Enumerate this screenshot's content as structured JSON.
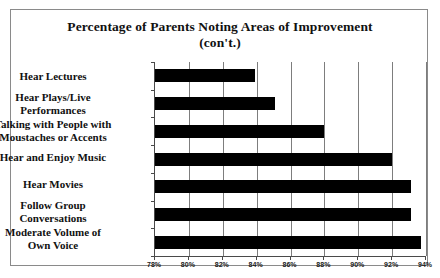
{
  "chart_data": {
    "type": "bar",
    "orientation": "horizontal",
    "title": "Percentage of Parents Noting Areas of Improvement (con't.)",
    "title_line1": "Percentage of Parents Noting Areas of Improvement",
    "title_line2": "(con't.)",
    "categories": [
      "Hear Lectures",
      "Hear Plays/Live Performances",
      "Talking with People with Moustaches or Accents",
      "Hear and Enjoy Music",
      "Hear Movies",
      "Follow Group Conversations",
      "Moderate Volume of Own Voice"
    ],
    "category_lines": [
      [
        "Hear Lectures"
      ],
      [
        "Hear Plays/Live",
        "Performances"
      ],
      [
        "Talking with People with",
        "Moustaches or Accents"
      ],
      [
        "Hear and Enjoy Music"
      ],
      [
        "Hear Movies"
      ],
      [
        "Follow Group",
        "Conversations"
      ],
      [
        "Moderate Volume of",
        "Own Voice"
      ]
    ],
    "values": [
      83.9,
      85.1,
      88.0,
      92.0,
      93.1,
      93.1,
      93.7
    ],
    "xlabel": "",
    "ylabel": "",
    "xlim": [
      78,
      94
    ],
    "xtick_values": [
      78,
      80,
      82,
      84,
      86,
      88,
      90,
      92,
      94
    ],
    "xtick_labels": [
      "78%",
      "80%",
      "82%",
      "84%",
      "86%",
      "88%",
      "90%",
      "92%",
      "94%"
    ],
    "grid": true,
    "legend": false,
    "bar_color": "#000000",
    "frame_color": "#8a8a8a",
    "background_color": "#ffffff"
  }
}
